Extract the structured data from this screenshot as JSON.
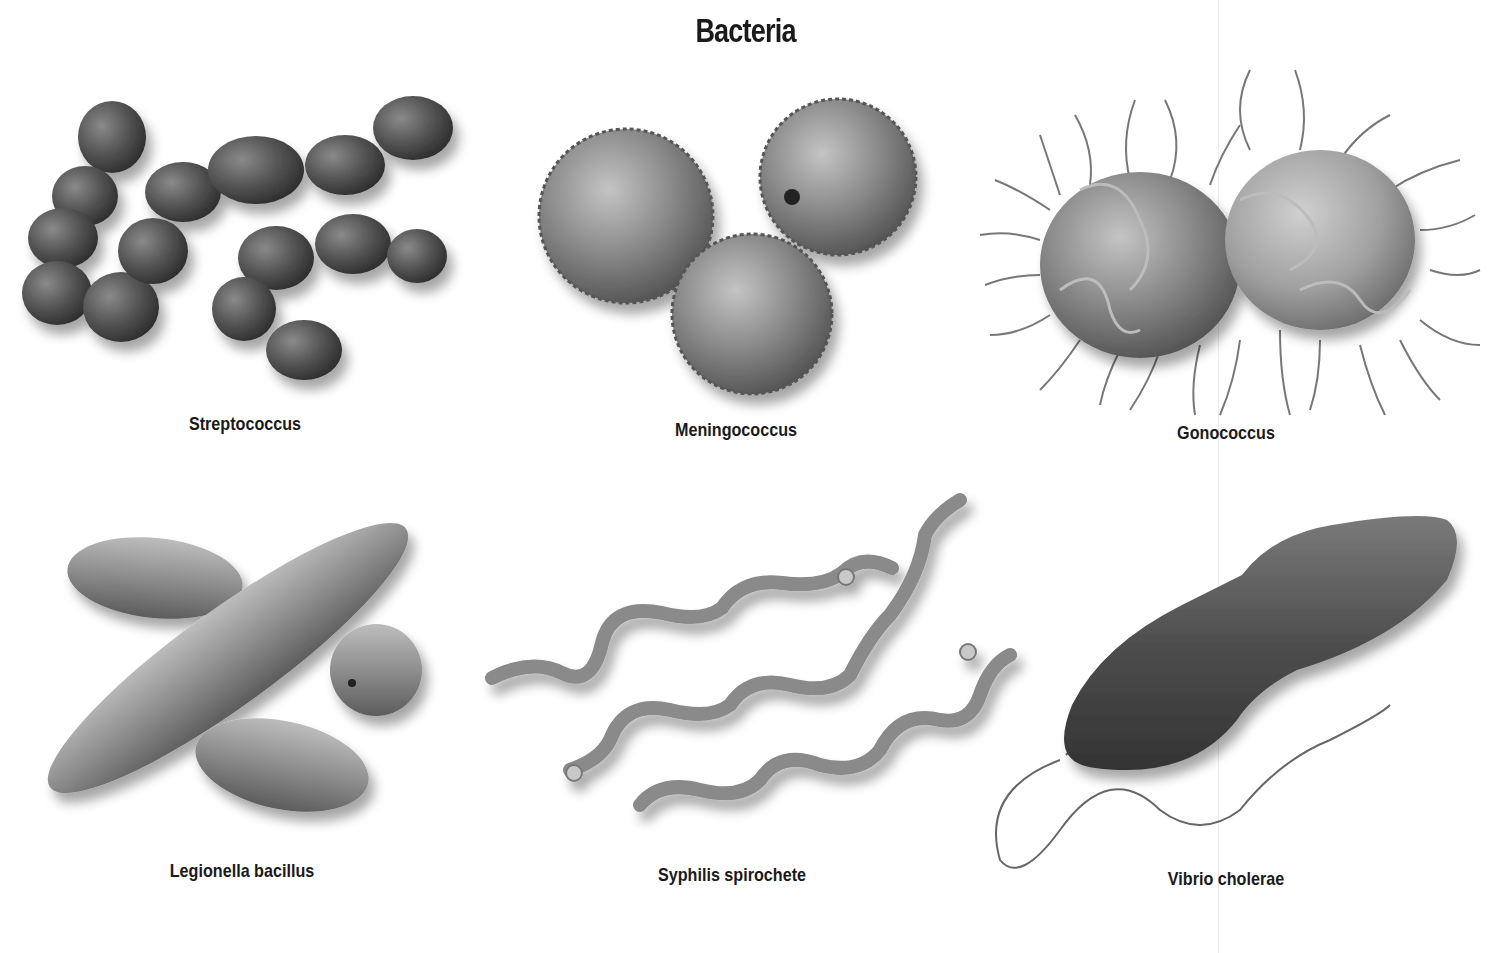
{
  "title": "Bacteria",
  "panels": [
    {
      "name": "Streptococcus",
      "label": "Streptococcus",
      "row": 1,
      "col": 1,
      "shape": "chain-of-spheres"
    },
    {
      "name": "Meningococcus",
      "label": "Meningococcus",
      "row": 1,
      "col": 2,
      "shape": "diplococci-cluster"
    },
    {
      "name": "Gonococcus",
      "label": "Gonococcus",
      "row": 1,
      "col": 3,
      "shape": "diplococcus-with-pili"
    },
    {
      "name": "Legionella bacillus",
      "label": "Legionella bacillus",
      "row": 2,
      "col": 1,
      "shape": "rods"
    },
    {
      "name": "Syphilis spirochete",
      "label": "Syphilis spirochete",
      "row": 2,
      "col": 2,
      "shape": "spirals"
    },
    {
      "name": "Vibrio cholerae",
      "label": "Vibrio cholerae",
      "row": 2,
      "col": 3,
      "shape": "curved-rod-with-flagellum"
    }
  ],
  "colors": {
    "background": "#ffffff",
    "text": "#1a1a1a",
    "cell_dark": "#4a4a4a",
    "cell_mid": "#7a7a7a",
    "cell_light": "#a8a8a8"
  }
}
